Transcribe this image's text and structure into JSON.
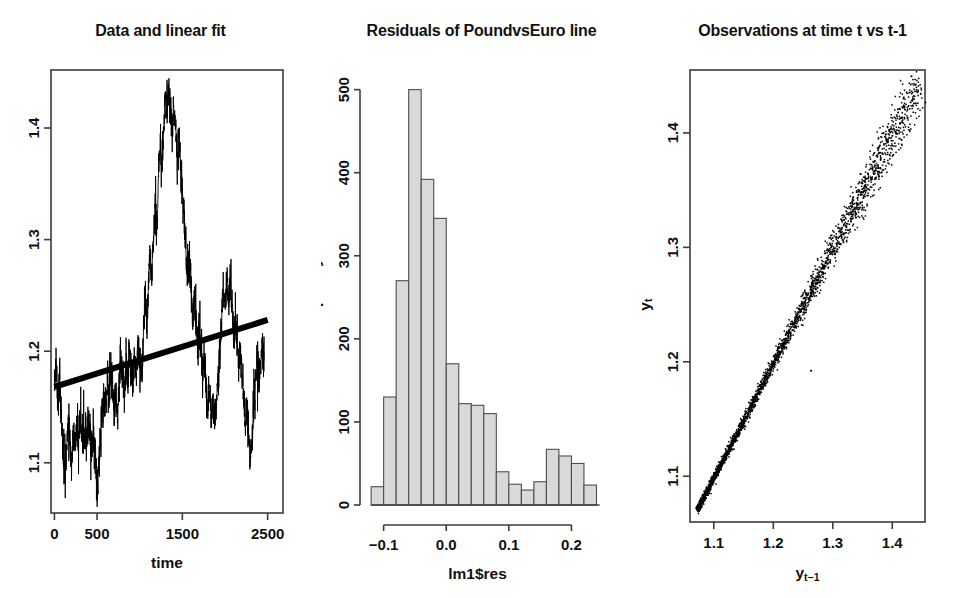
{
  "figure": {
    "background": "#ffffff",
    "panel_count": 3,
    "ink_color": "#000000",
    "hist_fill": "#d9d9d9"
  },
  "panels": [
    {
      "id": "timeseries",
      "title": "Data and linear fit",
      "xlabel": "time",
      "ylabel": "",
      "xticks": [
        "0",
        "500",
        "1500",
        "2500"
      ],
      "yticks": [
        "1.1",
        "1.2",
        "1.3",
        "1.4"
      ]
    },
    {
      "id": "histogram",
      "title": "Residuals of PoundvsEuro line",
      "xlabel": "lm1$res",
      "ylabel": "Frequency",
      "xticks": [
        "-0.1",
        "0.0",
        "0.1",
        "0.2"
      ],
      "yticks": [
        "0",
        "100",
        "200",
        "300",
        "400",
        "500"
      ]
    },
    {
      "id": "scatter",
      "title": "Observations at time t vs t-1",
      "xlabel_base": "y",
      "xlabel_sub": "t-1",
      "ylabel_base": "y",
      "ylabel_sub": "t",
      "xticks": [
        "1.1",
        "1.2",
        "1.3",
        "1.4"
      ],
      "yticks": [
        "1.1",
        "1.2",
        "1.3",
        "1.4"
      ]
    }
  ],
  "chart_data": [
    {
      "type": "line",
      "title": "Data and linear fit",
      "xlabel": "time",
      "ylabel": "",
      "xlim": [
        -40,
        2680
      ],
      "ylim": [
        1.055,
        1.452
      ],
      "xticks": [
        0,
        500,
        1500,
        2500
      ],
      "yticks": [
        1.1,
        1.2,
        1.3,
        1.4
      ],
      "grid": false,
      "legend": null,
      "series": [
        {
          "name": "PoundvsEuro",
          "kind": "line",
          "x": [
            0,
            20,
            40,
            60,
            80,
            100,
            120,
            140,
            160,
            180,
            200,
            220,
            240,
            260,
            280,
            300,
            320,
            340,
            360,
            380,
            400,
            420,
            440,
            460,
            480,
            500,
            520,
            540,
            560,
            580,
            600,
            620,
            640,
            660,
            680,
            700,
            720,
            740,
            760,
            780,
            800,
            820,
            840,
            860,
            880,
            900,
            920,
            940,
            960,
            980,
            1000,
            1020,
            1040,
            1060,
            1080,
            1100,
            1120,
            1140,
            1160,
            1180,
            1200,
            1220,
            1240,
            1260,
            1280,
            1300,
            1320,
            1340,
            1360,
            1380,
            1400,
            1420,
            1440,
            1460,
            1480,
            1500,
            1520,
            1540,
            1560,
            1580,
            1600,
            1620,
            1640,
            1660,
            1680,
            1700,
            1720,
            1740,
            1760,
            1780,
            1800,
            1820,
            1840,
            1860,
            1880,
            1900,
            1920,
            1940,
            1960,
            1980,
            2000,
            2020,
            2040,
            2060,
            2080,
            2100,
            2120,
            2140,
            2160,
            2180,
            2200,
            2220,
            2240,
            2260,
            2280,
            2300,
            2320,
            2340,
            2360,
            2380,
            2400,
            2420,
            2440,
            2460,
            2480,
            2500
          ],
          "y": [
            1.168,
            1.196,
            1.15,
            1.175,
            1.14,
            1.119,
            1.09,
            1.108,
            1.14,
            1.118,
            1.1,
            1.125,
            1.112,
            1.135,
            1.12,
            1.142,
            1.128,
            1.118,
            1.13,
            1.122,
            1.135,
            1.124,
            1.118,
            1.13,
            1.108,
            1.072,
            1.1,
            1.126,
            1.145,
            1.16,
            1.148,
            1.172,
            1.158,
            1.185,
            1.17,
            1.15,
            1.162,
            1.14,
            1.175,
            1.195,
            1.18,
            1.16,
            1.188,
            1.172,
            1.2,
            1.183,
            1.17,
            1.195,
            1.178,
            1.21,
            1.188,
            1.175,
            1.205,
            1.25,
            1.228,
            1.26,
            1.285,
            1.265,
            1.3,
            1.33,
            1.31,
            1.355,
            1.385,
            1.362,
            1.4,
            1.43,
            1.408,
            1.438,
            1.415,
            1.395,
            1.42,
            1.398,
            1.372,
            1.395,
            1.37,
            1.345,
            1.32,
            1.29,
            1.262,
            1.285,
            1.258,
            1.23,
            1.25,
            1.228,
            1.205,
            1.22,
            1.198,
            1.175,
            1.192,
            1.17,
            1.148,
            1.165,
            1.142,
            1.16,
            1.14,
            1.158,
            1.175,
            1.205,
            1.23,
            1.255,
            1.238,
            1.268,
            1.245,
            1.262,
            1.24,
            1.215,
            1.235,
            1.208,
            1.185,
            1.205,
            1.18,
            1.158,
            1.132,
            1.15,
            1.12,
            1.105,
            1.128,
            1.15,
            1.175,
            1.195,
            1.17,
            1.192,
            1.21,
            1.188
          ],
          "color": "#000000"
        },
        {
          "name": "linear fit",
          "kind": "line",
          "x": [
            0,
            2500
          ],
          "y": [
            1.168,
            1.228
          ],
          "color": "#000000",
          "linewidth": 5
        }
      ]
    },
    {
      "type": "bar",
      "subtype": "histogram",
      "title": "Residuals of PoundvsEuro line",
      "xlabel": "lm1$res",
      "ylabel": "Frequency",
      "xlim": [
        -0.125,
        0.26
      ],
      "ylim": [
        0,
        520
      ],
      "xticks": [
        -0.1,
        0.0,
        0.1,
        0.2
      ],
      "yticks": [
        0,
        100,
        200,
        300,
        400,
        500
      ],
      "grid": false,
      "legend": null,
      "bin_width": 0.02,
      "bin_starts": [
        -0.12,
        -0.1,
        -0.08,
        -0.06,
        -0.04,
        -0.02,
        0.0,
        0.02,
        0.04,
        0.06,
        0.08,
        0.1,
        0.12,
        0.14,
        0.16,
        0.18,
        0.2,
        0.22
      ],
      "categories": [
        "-0.12",
        "-0.10",
        "-0.08",
        "-0.06",
        "-0.04",
        "-0.02",
        "0.00",
        "0.02",
        "0.04",
        "0.06",
        "0.08",
        "0.10",
        "0.12",
        "0.14",
        "0.16",
        "0.18",
        "0.20",
        "0.22"
      ],
      "values": [
        22,
        130,
        270,
        500,
        392,
        345,
        170,
        122,
        120,
        110,
        40,
        25,
        18,
        28,
        67,
        59,
        50,
        24
      ],
      "fill_color": "#d9d9d9",
      "edge_color": "#4d4d4d"
    },
    {
      "type": "scatter",
      "title": "Observations at time t vs t-1",
      "xlabel": "y_{t-1}",
      "ylabel": "y_t",
      "xlim": [
        1.06,
        1.455
      ],
      "ylim": [
        1.06,
        1.455
      ],
      "xticks": [
        1.1,
        1.2,
        1.3,
        1.4
      ],
      "yticks": [
        1.1,
        1.2,
        1.3,
        1.4
      ],
      "grid": false,
      "legend": null,
      "n_points": 2500,
      "relationship": "y_t approximately equals y_{t-1} (AR(1), slope ~1)",
      "marker": "point",
      "color": "#000000",
      "description": "Dense near-diagonal cloud from (1.07,1.07) to (1.44,1.44); tight at low values, wider spread above 1.28; one isolated outlier near (1.26,1.19)"
    }
  ]
}
